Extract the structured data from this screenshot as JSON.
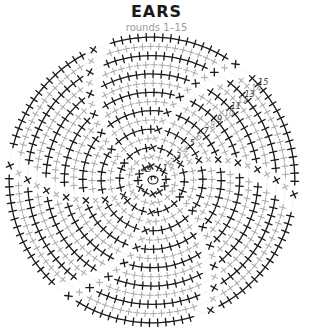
{
  "header": {
    "title": "EARS",
    "subtitle": "rounds 1–15"
  },
  "chart": {
    "type": "crochet-round-chart",
    "center": [
      152,
      180
    ],
    "rounds": 15,
    "segments": 6,
    "ring_radius": 7,
    "round_spacing": 9.2,
    "start_radius": 14,
    "stitch_symbol": "single-crochet (+)",
    "colors": {
      "odd_round": "#1a1a1a",
      "even_round": "#a8a8a8",
      "numbers_odd": "#333333",
      "numbers_even": "#9a9a9a"
    },
    "round_labels": [
      "1",
      "2",
      "3",
      "4",
      "5",
      "6",
      "7",
      "8",
      "9",
      "10",
      "11",
      "12",
      "13",
      "14",
      "15"
    ],
    "center_labels": [
      "x",
      "9"
    ],
    "label_angle_deg": -42
  }
}
